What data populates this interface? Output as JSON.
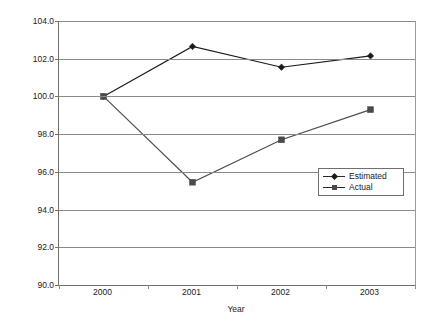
{
  "chart_data": {
    "type": "line",
    "title": "",
    "xlabel": "Year",
    "ylabel": "2000 = 100",
    "categories": [
      "2000",
      "2001",
      "2002",
      "2003"
    ],
    "series": [
      {
        "name": "Estimated",
        "marker": "diamond",
        "color": "#1a1a1a",
        "values": [
          100.0,
          102.65,
          101.55,
          102.15
        ]
      },
      {
        "name": "Actual",
        "marker": "square",
        "color": "#4a4a4a",
        "values": [
          100.0,
          95.45,
          97.7,
          99.3
        ]
      }
    ],
    "ylim": [
      90.0,
      104.0
    ],
    "ytick_step": 2.0,
    "yticks": [
      "90.0",
      "92.0",
      "94.0",
      "96.0",
      "98.0",
      "100.0",
      "102.0",
      "104.0"
    ],
    "grid": true,
    "legend_position": "inside-right"
  },
  "legend": {
    "entries": [
      {
        "label": "Estimated",
        "marker": "diamond-marker-icon"
      },
      {
        "label": "Actual",
        "marker": "square-marker-icon"
      }
    ]
  },
  "colors": {
    "axis": "#6f6f6f",
    "grid": "#8a8a8a",
    "estimated": "#1a1a1a",
    "actual": "#4a4a4a",
    "background": "#ffffff"
  }
}
